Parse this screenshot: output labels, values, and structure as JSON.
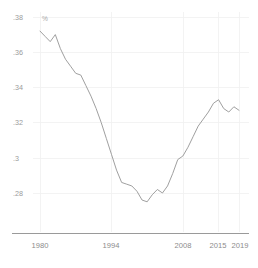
{
  "chart_data": {
    "type": "line",
    "title": "",
    "xlabel": "",
    "ylabel": "",
    "unit_label": "%",
    "xlim": [
      1980,
      2019
    ],
    "ylim": [
      0.268,
      0.382
    ],
    "grid": true,
    "legend": "none",
    "x_ticks": [
      1980,
      1994,
      2008,
      2015,
      2019
    ],
    "x_tick_labels": [
      "1980",
      "1994",
      "2008",
      "2015",
      "2019"
    ],
    "y_ticks": [
      0.38,
      0.36,
      0.34,
      0.32,
      0.3,
      0.28
    ],
    "y_tick_labels": [
      ".38",
      ".36",
      ".34",
      ".32",
      ".3",
      ".28"
    ],
    "series": [
      {
        "name": "labour share",
        "color": "#9a9a9a",
        "x": [
          1980,
          1981,
          1982,
          1983,
          1984,
          1985,
          1986,
          1987,
          1988,
          1989,
          1990,
          1991,
          1992,
          1993,
          1994,
          1995,
          1996,
          1997,
          1998,
          1999,
          2000,
          2001,
          2002,
          2003,
          2004,
          2005,
          2006,
          2007,
          2008,
          2009,
          2010,
          2011,
          2012,
          2013,
          2014,
          2015,
          2016,
          2017,
          2018,
          2019
        ],
        "values": [
          0.372,
          0.369,
          0.366,
          0.37,
          0.362,
          0.356,
          0.352,
          0.348,
          0.347,
          0.341,
          0.335,
          0.328,
          0.32,
          0.311,
          0.302,
          0.293,
          0.286,
          0.285,
          0.284,
          0.281,
          0.276,
          0.275,
          0.279,
          0.282,
          0.28,
          0.284,
          0.291,
          0.299,
          0.301,
          0.306,
          0.312,
          0.318,
          0.322,
          0.326,
          0.331,
          0.333,
          0.328,
          0.326,
          0.329,
          0.327
        ]
      }
    ]
  },
  "axis": {
    "unit": "%"
  }
}
